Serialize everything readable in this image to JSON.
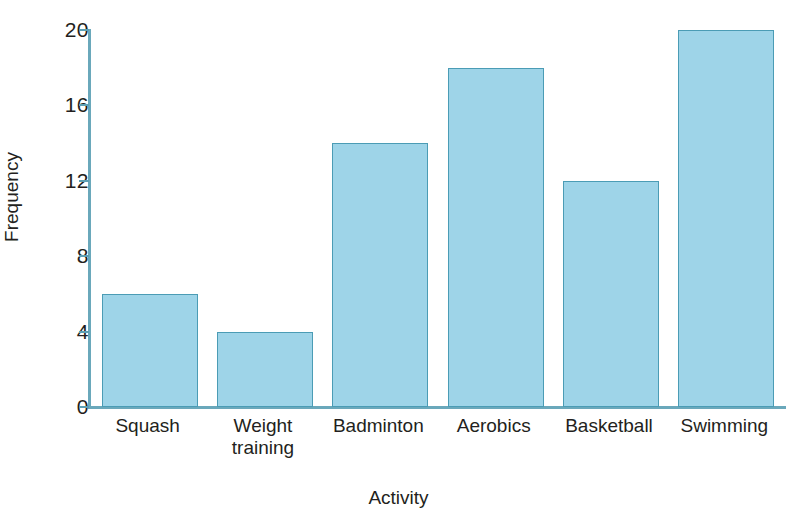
{
  "chart_data": {
    "type": "bar",
    "title": "",
    "xlabel": "Activity",
    "ylabel": "Frequency",
    "categories": [
      "Squash",
      "Weight training",
      "Badminton",
      "Aerobics",
      "Basketball",
      "Swimming"
    ],
    "category_lines": [
      [
        "Squash"
      ],
      [
        "Weight",
        "training"
      ],
      [
        "Badminton"
      ],
      [
        "Aerobics"
      ],
      [
        "Basketball"
      ],
      [
        "Swimming"
      ]
    ],
    "values": [
      6,
      4,
      14,
      18,
      12,
      20
    ],
    "ylim": [
      0,
      20
    ],
    "ytick_values": [
      0,
      4,
      8,
      12,
      16,
      20
    ],
    "ytick_labels": [
      "0",
      "4",
      "8",
      "12",
      "16",
      "20"
    ],
    "grid": false,
    "legend": null,
    "bar_fill_color": "#9ed4e8",
    "bar_border_color": "#4b9cb5",
    "axis_color": "#6aa8bb",
    "text_color": "#231f20",
    "background_color": "#ffffff"
  }
}
